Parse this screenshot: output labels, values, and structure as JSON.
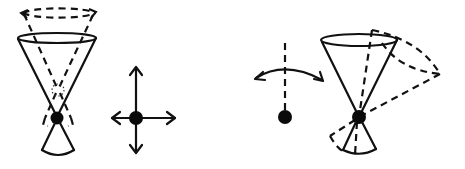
{
  "diagram": {
    "background": "#ffffff",
    "ink_color": "#111111",
    "figures": [
      {
        "id": "cone-precession",
        "description": "Upright cone (hourglass) with pivot dot at apex; dashed ghost cone shifted upward with curved rotation arrows on upper dashed ellipse; dotted circle marking previous pivot position"
      },
      {
        "id": "translation-cross",
        "description": "Pivot dot with four-way arrows (up, down, left, right)"
      },
      {
        "id": "pendulum-swing",
        "description": "Dashed vertical axis above a pivot dot with a curved double-headed arc arrow"
      },
      {
        "id": "cone-tilt",
        "description": "Upright hourglass cone with solid lines and a dashed tilted copy rotated about the apex dot"
      }
    ]
  }
}
